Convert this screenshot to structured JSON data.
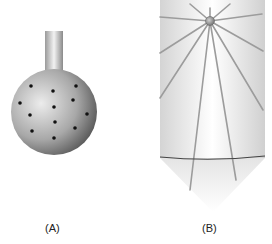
{
  "panels": [
    {
      "id": "A",
      "label": "(A)",
      "description": "sphere on stem with dots",
      "dots": [
        [
          31,
          86
        ],
        [
          53,
          91
        ],
        [
          76,
          86
        ],
        [
          20,
          103
        ],
        [
          73,
          100
        ],
        [
          54,
          107
        ],
        [
          30,
          115
        ],
        [
          87,
          114
        ],
        [
          55,
          122
        ],
        [
          75,
          128
        ],
        [
          32,
          131
        ],
        [
          54,
          138
        ]
      ]
    },
    {
      "id": "B",
      "label": "(B)",
      "description": "cylinder with radiating lines from bead"
    }
  ],
  "colors": {
    "sphere_light": "#e8e8e8",
    "sphere_dark": "#5a5a5a",
    "dot": "#111111",
    "ray": "#9a9a9a",
    "arc": "#444444"
  }
}
